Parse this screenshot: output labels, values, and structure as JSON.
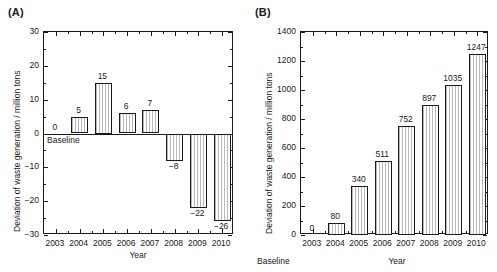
{
  "figure": {
    "panels": [
      {
        "key": "A",
        "label": "(A)",
        "axis_x_title": "Year",
        "axis_y_title": "Deviation of waste generation / million tons",
        "baseline_note": "Baseline",
        "chart": {
          "type": "bar",
          "title": "",
          "xlabel": "Year",
          "ylabel": "Deviation of waste generation / million tons",
          "categories": [
            "2003",
            "2004",
            "2005",
            "2006",
            "2007",
            "2008",
            "2009",
            "2010"
          ],
          "values": [
            0,
            5,
            15,
            6,
            7,
            -8,
            -22,
            -26
          ],
          "value_labels": [
            "0",
            "5",
            "15",
            "6",
            "7",
            "−8",
            "−22",
            "−26"
          ],
          "ylim": [
            -30,
            30
          ],
          "yticks": [
            -30,
            -20,
            -10,
            0,
            10,
            20,
            30
          ],
          "ytick_labels": [
            "−30",
            "−20",
            "−10",
            "0",
            "10",
            "20",
            "30"
          ],
          "yminor_step": 5,
          "grid": false,
          "legend": false,
          "baseline_category": "2003",
          "annotations": [
            {
              "text": "Baseline",
              "category": "2003",
              "value": 0
            }
          ]
        }
      },
      {
        "key": "B",
        "label": "(B)",
        "axis_x_title": "Year",
        "axis_y_title": "Deviation of waste generation / million tons",
        "baseline_note": "Baseline",
        "chart": {
          "type": "bar",
          "title": "",
          "xlabel": "Year",
          "ylabel": "Deviation of waste generation / million tons",
          "categories": [
            "2003",
            "2004",
            "2005",
            "2006",
            "2007",
            "2008",
            "2009",
            "2010"
          ],
          "values": [
            0,
            80,
            340,
            511,
            752,
            897,
            1035,
            1247
          ],
          "value_labels": [
            "0",
            "80",
            "340",
            "511",
            "752",
            "897",
            "1035",
            "1247"
          ],
          "ylim": [
            0,
            1400
          ],
          "yticks": [
            0,
            200,
            400,
            600,
            800,
            1000,
            1200,
            1400
          ],
          "ytick_labels": [
            "0",
            "200",
            "400",
            "600",
            "800",
            "1000",
            "1200",
            "1400"
          ],
          "yminor_step": 100,
          "grid": false,
          "legend": false,
          "baseline_category": "2003",
          "annotations": [
            {
              "text": "Baseline",
              "category": "2003",
              "value": 0
            }
          ]
        }
      }
    ]
  },
  "chart_data": [
    {
      "type": "bar",
      "panel": "(A)",
      "categories": [
        "2003",
        "2004",
        "2005",
        "2006",
        "2007",
        "2008",
        "2009",
        "2010"
      ],
      "values": [
        0,
        5,
        15,
        6,
        7,
        -8,
        -22,
        -26
      ],
      "title": "",
      "xlabel": "Year",
      "ylabel": "Deviation of waste generation / million tons",
      "ylim": [
        -30,
        30
      ],
      "yticks": [
        -30,
        -20,
        -10,
        0,
        10,
        20,
        30
      ],
      "grid": false,
      "legend_position": "none",
      "annotations": [
        "Baseline at 2003"
      ]
    },
    {
      "type": "bar",
      "panel": "(B)",
      "categories": [
        "2003",
        "2004",
        "2005",
        "2006",
        "2007",
        "2008",
        "2009",
        "2010"
      ],
      "values": [
        0,
        80,
        340,
        511,
        752,
        897,
        1035,
        1247
      ],
      "title": "",
      "xlabel": "Year",
      "ylabel": "Deviation of waste generation / million tons",
      "ylim": [
        0,
        1400
      ],
      "yticks": [
        0,
        200,
        400,
        600,
        800,
        1000,
        1200,
        1400
      ],
      "grid": false,
      "legend_position": "none",
      "annotations": [
        "Baseline at 2003"
      ]
    }
  ]
}
